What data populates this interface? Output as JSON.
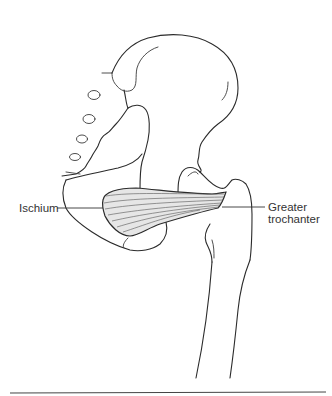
{
  "figure": {
    "labels": {
      "ischium": "Ischium",
      "greater_trochanter_line1": "Greater",
      "greater_trochanter_line2": "trochanter"
    },
    "colors": {
      "line": "#2b2b2b",
      "muscle_fill": "#e6e6e6",
      "muscle_fibers": "#555555",
      "background": "#ffffff",
      "rule": "#444444"
    }
  }
}
